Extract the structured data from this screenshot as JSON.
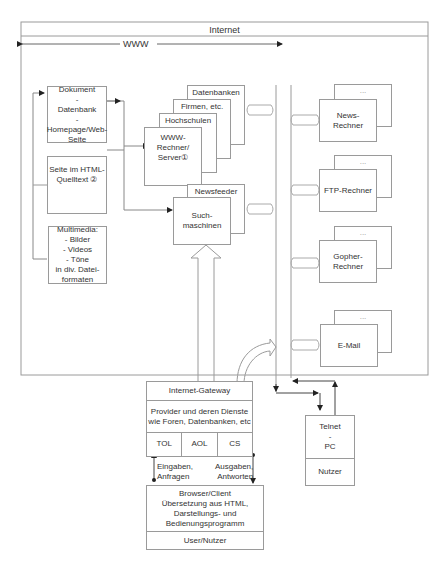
{
  "internet": {
    "title": "Internet"
  },
  "www": {
    "label": "WWW"
  },
  "left_stack": {
    "dokument": [
      "Dokument",
      "-",
      "Datenbank",
      "-",
      "Homepage/Web-",
      "Seite"
    ],
    "html_seite": [
      "Seite im HTML-",
      "Quelltext ②"
    ],
    "multimedia": [
      "Multimedia:",
      "- Bilder",
      "- Videos",
      "- Töne",
      "in div. Datei-",
      "formaten"
    ]
  },
  "server_stack": {
    "datenbanken": "Datenbanken",
    "firmen": "Firmen, etc.",
    "hochschulen": "Hochschulen",
    "www_rechner": [
      "WWW-",
      "Rechner/",
      "Server①"
    ]
  },
  "search": {
    "newsfeeder": "Newsfeeder",
    "suchmaschinen": [
      "Such-",
      "maschinen"
    ]
  },
  "right_servers": [
    {
      "back": "...",
      "front": [
        "News-",
        "Rechner"
      ]
    },
    {
      "back": "...",
      "front": [
        "FTP-Rechner"
      ]
    },
    {
      "back": "...",
      "front": [
        "Gopher-",
        "Rechner"
      ]
    },
    {
      "back": "...",
      "front": [
        "E-Mail"
      ]
    }
  ],
  "gateway": {
    "title": "Internet-Gateway",
    "provider": [
      "Provider und deren Dienste",
      "wie Foren, Datenbanken, etc"
    ],
    "services": [
      "TOL",
      "AOL",
      "CS"
    ]
  },
  "telnet": {
    "top": [
      "Telnet",
      "-",
      "PC"
    ],
    "bottom": "Nutzer"
  },
  "io": {
    "eingaben": [
      "Eingaben,",
      "Anfragen"
    ],
    "ausgaben": [
      "Ausgaben,",
      "Antworten"
    ]
  },
  "browser": {
    "top": [
      "Browser/Client",
      "Übersetzung aus HTML,",
      "Darstellungs- und",
      "Bedienungsprogramm"
    ],
    "bottom": "User/Nutzer"
  },
  "colors": {
    "line": "#9a9a9a",
    "dark": "#222222",
    "text": "#333333"
  }
}
